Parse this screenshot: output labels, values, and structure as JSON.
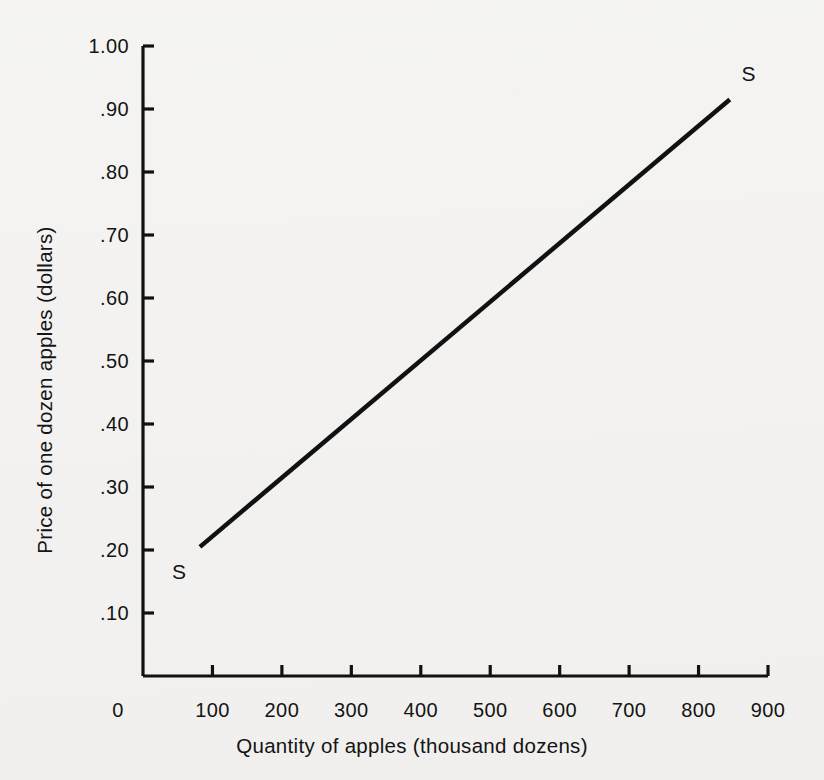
{
  "chart_data": {
    "type": "line",
    "title": "",
    "xlabel": "Quantity of apples (thousand dozens)",
    "ylabel": "Price of one dozen apples (dollars)",
    "xlim": [
      0,
      900
    ],
    "ylim": [
      0,
      1.0
    ],
    "grid": false,
    "legend": "none",
    "xticks": [
      0,
      100,
      200,
      300,
      400,
      500,
      600,
      700,
      800,
      900
    ],
    "xticklabels": [
      "0",
      "100",
      "200",
      "300",
      "400",
      "500",
      "600",
      "700",
      "800",
      "900"
    ],
    "yticks": [
      0.1,
      0.2,
      0.3,
      0.4,
      0.5,
      0.6,
      0.7,
      0.8,
      0.9,
      1.0
    ],
    "yticklabels": [
      ".10",
      ".20",
      ".30",
      ".40",
      ".50",
      ".60",
      ".70",
      ".80",
      ".90",
      "1.00"
    ],
    "series": [
      {
        "name": "S",
        "kind": "supply-curve",
        "x": [
          82,
          845
        ],
        "y": [
          0.205,
          0.915
        ],
        "color": "#111111",
        "linewidth": 4.5
      }
    ],
    "annotations": [
      {
        "text": "S",
        "x": 52,
        "y": 0.165,
        "name": "supply-label-lower"
      },
      {
        "text": "S",
        "x": 872,
        "y": 0.955,
        "name": "supply-label-upper"
      }
    ]
  },
  "axes": {
    "axis_color": "#111111",
    "tick_length": 11,
    "axis_linewidth": 3
  },
  "figure": {
    "background_color": "#f2f1ef",
    "width": 824,
    "height": 780
  }
}
